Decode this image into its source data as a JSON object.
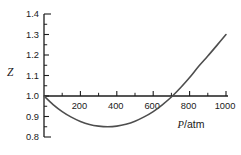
{
  "figure": {
    "background": "#ffffff",
    "axis_color": "#1c1c1c",
    "tick_label_color": "#1a1a1a",
    "curve_color": "#4e4e4e"
  },
  "chart_data": {
    "type": "line",
    "title": "",
    "ylabel": "Z",
    "xlabel_var": "P",
    "xlabel_unit": "/atm",
    "xlim": [
      0,
      1000
    ],
    "ylim": [
      0.8,
      1.4
    ],
    "x_axis_at_y": 1.0,
    "grid": false,
    "legend": null,
    "x_major_ticks": [
      200,
      400,
      600,
      800,
      1000
    ],
    "x_minor_ticks": [
      100,
      300,
      500,
      700,
      900
    ],
    "y_major_ticks": [
      0.8,
      0.9,
      1.0,
      1.1,
      1.2,
      1.3,
      1.4
    ],
    "y_minor_ticks": [
      0.85,
      0.95,
      1.05,
      1.15,
      1.25,
      1.35
    ],
    "series": [
      {
        "name": "compressibility-factor-curve",
        "x": [
          0,
          50,
          100,
          150,
          200,
          250,
          300,
          350,
          400,
          450,
          500,
          550,
          600,
          650,
          700,
          750,
          800,
          850,
          900,
          950,
          1000
        ],
        "y": [
          1.0,
          0.958,
          0.924,
          0.897,
          0.876,
          0.861,
          0.853,
          0.85,
          0.853,
          0.862,
          0.877,
          0.898,
          0.924,
          0.957,
          0.995,
          1.04,
          1.09,
          1.145,
          1.195,
          1.247,
          1.3
        ]
      }
    ]
  }
}
